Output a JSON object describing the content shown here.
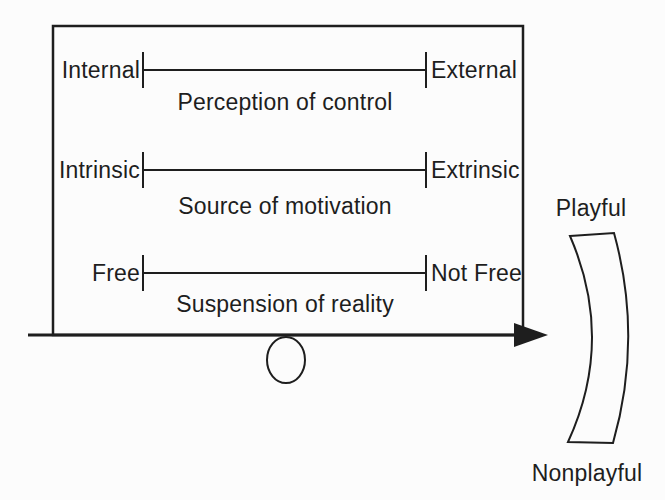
{
  "diagram": {
    "scales": [
      {
        "left": "Internal",
        "right": "External",
        "label": "Perception of control"
      },
      {
        "left": "Intrinsic",
        "right": "Extrinsic",
        "label": "Source of motivation"
      },
      {
        "left": "Free",
        "right": "Not Free",
        "label": "Suspension of reality"
      }
    ],
    "continuum": {
      "top_label": "Playful",
      "bottom_label": "Nonplayful"
    },
    "colors": {
      "ink": "#1e1e1e",
      "background": "#fcfcfc"
    }
  }
}
